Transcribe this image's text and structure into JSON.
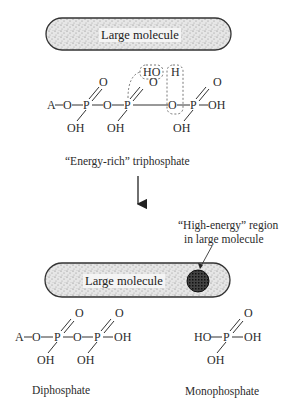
{
  "figure": {
    "top": {
      "molecule_label": "Large molecule",
      "triphosphate": {
        "A": "A",
        "O": "O",
        "P": "P",
        "OH": "OH",
        "HO_box": "HO",
        "H_box": "H"
      },
      "caption": "“Energy-rich” triphosphate"
    },
    "arrow": {
      "direction": "down"
    },
    "bottom": {
      "molecule_label": "Large molecule",
      "region_caption_line1": "“High-energy” region",
      "region_caption_line2": "in large molecule",
      "diphosphate": {
        "A": "A",
        "O": "O",
        "P": "P",
        "OH": "OH"
      },
      "monophosphate": {
        "HO": "HO",
        "P": "P",
        "O": "O",
        "OH": "OH"
      },
      "diphosphate_caption": "Diphosphate",
      "monophosphate_caption": "Monophosphate"
    }
  }
}
